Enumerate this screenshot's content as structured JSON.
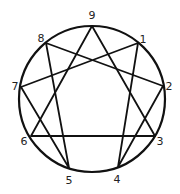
{
  "diagram": {
    "stroke_color": "#111111",
    "circle": {
      "cx": 92,
      "cy": 99,
      "r": 73
    },
    "points": [
      {
        "label": "9",
        "x": 92,
        "y": 26,
        "lx": 92,
        "ly": 19
      },
      {
        "label": "1",
        "x": 138,
        "y": 43,
        "lx": 143,
        "ly": 43
      },
      {
        "label": "2",
        "x": 163,
        "y": 86,
        "lx": 169,
        "ly": 90
      },
      {
        "label": "3",
        "x": 155,
        "y": 136,
        "lx": 160,
        "ly": 145
      },
      {
        "label": "4",
        "x": 118,
        "y": 167,
        "lx": 117,
        "ly": 183
      },
      {
        "label": "5",
        "x": 69,
        "y": 168,
        "lx": 69,
        "ly": 184
      },
      {
        "label": "6",
        "x": 31,
        "y": 136,
        "lx": 24,
        "ly": 145
      },
      {
        "label": "7",
        "x": 21,
        "y": 87,
        "lx": 15,
        "ly": 90
      },
      {
        "label": "8",
        "x": 46,
        "y": 43,
        "lx": 41,
        "ly": 42
      }
    ],
    "triangle": [
      "9",
      "3",
      "6"
    ],
    "hexad": [
      "1",
      "4",
      "2",
      "8",
      "5",
      "7"
    ]
  }
}
